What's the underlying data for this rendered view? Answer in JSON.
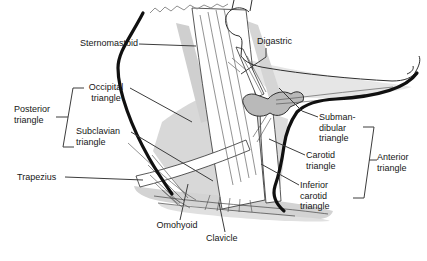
{
  "figure": {
    "type": "anatomical-diagram",
    "palette": {
      "background": "#ffffff",
      "outline": "#101010",
      "thin_line": "#2e2e2e",
      "leader_line": "#3c3c3c",
      "shade_light": "#e6e6e6",
      "shade_mid": "#d8d8d8",
      "shade_stipple": "#d3d3d3",
      "shade_dark": "#b9b9b9",
      "text": "#161616"
    },
    "labels": {
      "sternomastoid": {
        "text": "Sternomastoid"
      },
      "digastric": {
        "text": "Digastric"
      },
      "occipital": {
        "line1": "Occipital",
        "line2": "triangle"
      },
      "posterior": {
        "line1": "Posterior",
        "line2": "triangle"
      },
      "subclavian": {
        "line1": "Subclavian",
        "line2": "triangle"
      },
      "trapezius": {
        "text": "Trapezius"
      },
      "omohyoid": {
        "text": "Omohyoid"
      },
      "clavicle": {
        "text": "Clavicle"
      },
      "submandibular": {
        "line1": "Subman-",
        "line2": "dibular",
        "line3": "triangle"
      },
      "carotid": {
        "line1": "Carotid",
        "line2": "triangle"
      },
      "inferior_carotid": {
        "line1": "Inferior",
        "line2": "carotid",
        "line3": "triangle"
      },
      "anterior": {
        "line1": "Anterior",
        "line2": "triangle"
      }
    }
  }
}
